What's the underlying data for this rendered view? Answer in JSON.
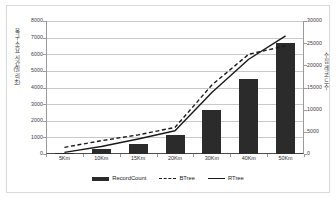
{
  "chart_data": {
    "type": "bar",
    "title": "",
    "xlabel": "",
    "ylabel": "복구 소요 시간 (밀리 초)",
    "y2label": "수집 레코드 수",
    "categories": [
      "5Km",
      "10Km",
      "15Km",
      "20Km",
      "30Km",
      "40Km",
      "50Km"
    ],
    "ylim": [
      0,
      8000
    ],
    "y2lim": [
      0,
      30000
    ],
    "yticks": [
      "0",
      "1000",
      "2000",
      "3000",
      "4000",
      "5000",
      "6000",
      "7000",
      "8000"
    ],
    "y2ticks": [
      "0",
      "5000",
      "10000",
      "15000",
      "20000",
      "25000",
      "30000"
    ],
    "grid": true,
    "legend_position": "bottom",
    "series": [
      {
        "name": "RecordCount",
        "type": "bar",
        "axis": "right",
        "color": "#2b2b2b",
        "values": [
          300,
          1200,
          2200,
          4200,
          10000,
          17000,
          25000
        ]
      },
      {
        "name": "BTree",
        "type": "line",
        "style": "dashed",
        "axis": "left",
        "color": "#1a1a1a",
        "values": [
          400,
          800,
          1150,
          1600,
          4150,
          6000,
          6500
        ]
      },
      {
        "name": "RTree",
        "type": "line",
        "style": "solid",
        "axis": "left",
        "color": "#1a1a1a",
        "values": [
          100,
          450,
          900,
          1400,
          3700,
          5700,
          7100
        ]
      }
    ]
  },
  "legend": {
    "items": [
      {
        "label": "RecordCount",
        "swatch": "bar-swatch"
      },
      {
        "label": "BTree",
        "swatch": "dashed-line-swatch"
      },
      {
        "label": "RTree",
        "swatch": "solid-line-swatch"
      }
    ]
  }
}
